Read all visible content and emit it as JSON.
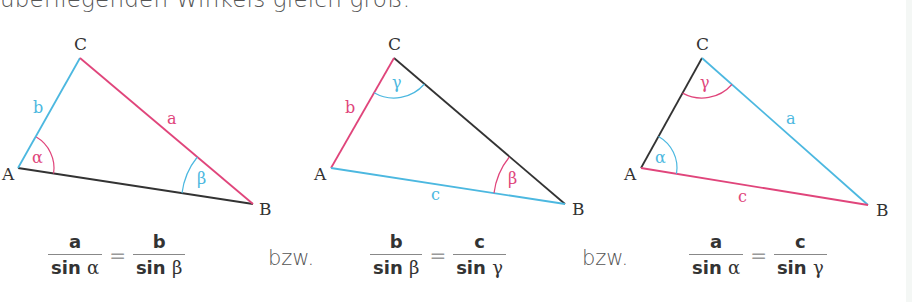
{
  "intro_text": "überliegenden Winkels gleich groß.",
  "colors": {
    "red": "#e0457b",
    "blue": "#4cb8e0",
    "black": "#333333"
  },
  "triangles": [
    {
      "vertices": {
        "A": "A",
        "B": "B",
        "C": "C"
      },
      "sides": {
        "a": "a",
        "b": "b",
        "c": ""
      },
      "angles": {
        "alpha": "α",
        "beta": "β"
      }
    },
    {
      "vertices": {
        "A": "A",
        "B": "B",
        "C": "C"
      },
      "sides": {
        "b": "b",
        "c": "c"
      },
      "angles": {
        "beta": "β",
        "gamma": "γ"
      }
    },
    {
      "vertices": {
        "A": "A",
        "B": "B",
        "C": "C"
      },
      "sides": {
        "a": "a",
        "c": "c"
      },
      "angles": {
        "alpha": "α",
        "gamma": "γ"
      }
    }
  ],
  "formulas": [
    {
      "left_num": "a",
      "left_den_fn": "sin",
      "left_den_angle": "α",
      "eq": "=",
      "right_num": "b",
      "right_den_fn": "sin",
      "right_den_angle": "β"
    },
    {
      "left_num": "b",
      "left_den_fn": "sin",
      "left_den_angle": "β",
      "eq": "=",
      "right_num": "c",
      "right_den_fn": "sin",
      "right_den_angle": "γ"
    },
    {
      "left_num": "a",
      "left_den_fn": "sin",
      "left_den_angle": "α",
      "eq": "=",
      "right_num": "c",
      "right_den_fn": "sin",
      "right_den_angle": "γ"
    }
  ],
  "separators": [
    "bzw.",
    "bzw."
  ]
}
